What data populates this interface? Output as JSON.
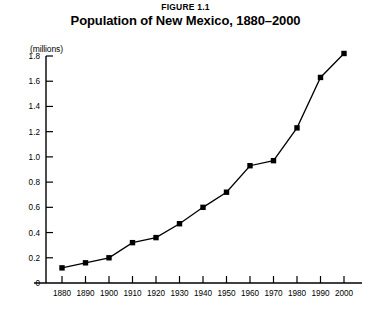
{
  "figure": {
    "number_label": "FIGURE 1.1",
    "title": "Population of New Mexico, 1880–2000",
    "units_label": "(millions)"
  },
  "chart_data": {
    "type": "line",
    "title": "Population of New Mexico, 1880–2000",
    "subtitle": "FIGURE 1.1",
    "xlabel": "",
    "ylabel": "(millions)",
    "x": [
      1880,
      1890,
      1900,
      1910,
      1920,
      1930,
      1940,
      1950,
      1960,
      1970,
      1980,
      1990,
      2000
    ],
    "categories": [
      "1880",
      "1890",
      "1900",
      "1910",
      "1920",
      "1930",
      "1940",
      "1950",
      "1960",
      "1970",
      "1980",
      "1990",
      "2000"
    ],
    "values": [
      0.12,
      0.16,
      0.2,
      0.32,
      0.36,
      0.47,
      0.6,
      0.72,
      0.93,
      0.97,
      1.23,
      1.63,
      1.82
    ],
    "series": [
      {
        "name": "Population of New Mexico",
        "values": [
          0.12,
          0.16,
          0.2,
          0.32,
          0.36,
          0.47,
          0.6,
          0.72,
          0.93,
          0.97,
          1.23,
          1.63,
          1.82
        ]
      }
    ],
    "xlim": [
      1880,
      2000
    ],
    "ylim": [
      0,
      1.8
    ],
    "ytick_values": [
      0,
      0.2,
      0.4,
      0.6,
      0.8,
      1.0,
      1.2,
      1.4,
      1.6,
      1.8
    ],
    "ytick_labels": [
      "0",
      "0.2",
      "0.4",
      "0.6",
      "0.8",
      "1.0",
      "1.2",
      "1.4",
      "1.6",
      "1.8"
    ],
    "xtick_labels": [
      "1880",
      "1890",
      "1900",
      "1910",
      "1920",
      "1930",
      "1940",
      "1950",
      "1960",
      "1970",
      "1980",
      "1990",
      "2000"
    ],
    "grid": false,
    "legend": false,
    "marker": "square",
    "line_color": "#000000",
    "marker_color": "#000000",
    "axis_color": "#000000",
    "background_color": "#ffffff"
  }
}
